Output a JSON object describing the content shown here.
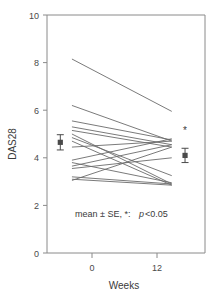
{
  "chart_data": {
    "type": "line",
    "title": "",
    "xlabel": "Weeks",
    "ylabel": "DAS28",
    "xlim": [
      -3,
      16
    ],
    "ylim": [
      0,
      10
    ],
    "x_ticks": [
      0,
      12
    ],
    "x_tick_labels": [
      "0",
      "12"
    ],
    "y_ticks": [
      0,
      2,
      4,
      6,
      8,
      10
    ],
    "y_tick_labels": [
      "0",
      "2",
      "4",
      "6",
      "8",
      "10"
    ],
    "grid": false,
    "legend": "none",
    "x": [
      0,
      12
    ],
    "series": [
      {
        "name": "patient-1",
        "values": [
          8.15,
          5.95
        ]
      },
      {
        "name": "patient-2",
        "values": [
          6.2,
          4.7
        ]
      },
      {
        "name": "patient-3",
        "values": [
          5.55,
          4.75
        ]
      },
      {
        "name": "patient-4",
        "values": [
          5.3,
          4.55
        ]
      },
      {
        "name": "patient-5",
        "values": [
          5.15,
          4.45
        ]
      },
      {
        "name": "patient-6",
        "values": [
          5.0,
          2.9
        ]
      },
      {
        "name": "patient-7",
        "values": [
          4.85,
          3.25
        ]
      },
      {
        "name": "patient-8",
        "values": [
          4.7,
          2.85
        ]
      },
      {
        "name": "patient-9",
        "values": [
          4.45,
          4.7
        ]
      },
      {
        "name": "patient-10",
        "values": [
          3.9,
          4.8
        ]
      },
      {
        "name": "patient-11",
        "values": [
          3.8,
          2.95
        ]
      },
      {
        "name": "patient-12",
        "values": [
          3.65,
          4.55
        ]
      },
      {
        "name": "patient-13",
        "values": [
          3.55,
          4.0
        ]
      },
      {
        "name": "patient-14",
        "values": [
          3.2,
          2.9
        ]
      },
      {
        "name": "patient-15",
        "values": [
          3.1,
          2.85
        ]
      },
      {
        "name": "patient-16",
        "values": [
          3.05,
          4.45
        ]
      }
    ],
    "summary": {
      "name": "mean-se",
      "points": [
        {
          "label": "baseline",
          "x": -1.4,
          "mean": 4.65,
          "se": 0.32,
          "significant": false
        },
        {
          "label": "week-12",
          "x": 13.6,
          "mean": 4.1,
          "se": 0.3,
          "significant": true
        }
      ]
    },
    "annotations": [
      {
        "name": "stats-note",
        "text_plain": "mean ± SE, *:",
        "text_italic": "p",
        "text_tail": "<0.05"
      }
    ],
    "colors": {
      "line": "#6b6b6b",
      "axis": "#8a8a8a",
      "marker": "#4a4a4a",
      "text": "#3a3a3a"
    }
  }
}
